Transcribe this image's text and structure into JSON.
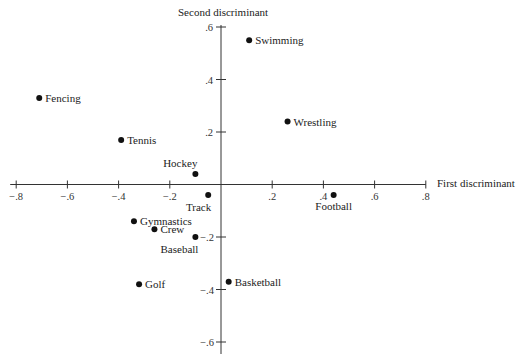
{
  "chart_data": {
    "type": "scatter",
    "title": "",
    "xlabel": "First discriminant",
    "ylabel": "Second discriminant",
    "xlim": [
      -0.8,
      0.8
    ],
    "ylim": [
      -0.6,
      0.6
    ],
    "grid": false,
    "legend": "none",
    "x_ticks": [
      "-.8",
      "-.6",
      "-.4",
      "-.2",
      ".2",
      ".4",
      ".6",
      ".8"
    ],
    "x_tick_values": [
      -0.8,
      -0.6,
      -0.4,
      -0.2,
      0.2,
      0.4,
      0.6,
      0.8
    ],
    "y_ticks": [
      ".6",
      ".4",
      ".2",
      "-.2",
      "-.4",
      "-.6"
    ],
    "y_tick_values": [
      0.6,
      0.4,
      0.2,
      -0.2,
      -0.4,
      -0.6
    ],
    "points": [
      {
        "label": "Swimming",
        "x": 0.11,
        "y": 0.55,
        "label_pos": "right"
      },
      {
        "label": "Fencing",
        "x": -0.71,
        "y": 0.33,
        "label_pos": "right"
      },
      {
        "label": "Wrestling",
        "x": 0.26,
        "y": 0.24,
        "label_pos": "right"
      },
      {
        "label": "Tennis",
        "x": -0.39,
        "y": 0.17,
        "label_pos": "right"
      },
      {
        "label": "Hockey",
        "x": -0.1,
        "y": 0.04,
        "label_pos": "above-left"
      },
      {
        "label": "Track",
        "x": -0.05,
        "y": -0.04,
        "label_pos": "below-left"
      },
      {
        "label": "Football",
        "x": 0.44,
        "y": -0.04,
        "label_pos": "below"
      },
      {
        "label": "Gymnastics",
        "x": -0.34,
        "y": -0.14,
        "label_pos": "right"
      },
      {
        "label": "Crew",
        "x": -0.26,
        "y": -0.17,
        "label_pos": "right"
      },
      {
        "label": "Baseball",
        "x": -0.1,
        "y": -0.2,
        "label_pos": "below-left"
      },
      {
        "label": "Golf",
        "x": -0.32,
        "y": -0.38,
        "label_pos": "right"
      },
      {
        "label": "Basketball",
        "x": 0.03,
        "y": -0.37,
        "label_pos": "right"
      }
    ]
  },
  "colors": {
    "axis": "#333333",
    "point": "#111111",
    "text": "#222222"
  }
}
